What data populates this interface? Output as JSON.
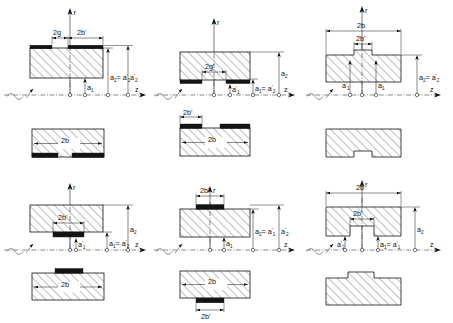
{
  "figure": {
    "axis_labels": {
      "radial": "r",
      "axial": "z"
    },
    "source_symbol": "ac-source-sine"
  },
  "symbols": {
    "two_b": "2b",
    "two_b_prime": "2b'",
    "two_g": "2g",
    "two_g_prime": "2g'",
    "a1": "a",
    "a1_sub": "1",
    "a2": "a",
    "a2_sub": "2"
  },
  "panels": [
    {
      "id": "r1c1",
      "name": "top-electrode-gap-section",
      "row": 1,
      "col": 1,
      "view": "cross-section",
      "electrode_side": "top",
      "notch": false,
      "dimensions": [
        {
          "name": "gap-width",
          "text": "2g"
        },
        {
          "name": "electrode-width",
          "text": "2b'"
        }
      ],
      "labels": [
        {
          "name": "a1-label",
          "text": "a",
          "sub": "1"
        },
        {
          "name": "a2-equals-a1prime-label",
          "text": "a",
          "sub": "2",
          "eq": "= a",
          "eq_sub": "1",
          "prime": true
        },
        {
          "name": "a2prime-label",
          "text": "a",
          "sub": "2",
          "prime": true
        }
      ],
      "axis_r": "r",
      "axis_z": "z"
    },
    {
      "id": "r1c2",
      "name": "bottom-electrode-gap-section",
      "row": 1,
      "col": 2,
      "view": "cross-section",
      "electrode_side": "bottom",
      "notch": false,
      "dimensions": [
        {
          "name": "gap-width",
          "text": "2g'"
        }
      ],
      "labels": [
        {
          "name": "a1prime-label",
          "text": "a",
          "sub": "1",
          "prime": true
        },
        {
          "name": "a1-equals-a2prime-label",
          "text": "a",
          "sub": "1",
          "eq": "= a",
          "eq_sub": "2",
          "prime": true
        },
        {
          "name": "a2-label",
          "text": "a",
          "sub": "2"
        }
      ],
      "axis_r": "r",
      "axis_z": "z"
    },
    {
      "id": "r1c3",
      "name": "top-notch-section",
      "row": 1,
      "col": 3,
      "view": "cross-section",
      "electrode_side": "none",
      "notch": "top",
      "dimensions": [
        {
          "name": "total-width",
          "text": "2b"
        },
        {
          "name": "notch-width",
          "text": "2b'"
        }
      ],
      "labels": [
        {
          "name": "a1prime-label",
          "text": "a",
          "sub": "1",
          "prime": true
        },
        {
          "name": "a1-label",
          "text": "a",
          "sub": "1"
        },
        {
          "name": "a2-equals-a2prime-label",
          "text": "a",
          "sub": "2",
          "eq": "= a",
          "eq_sub": "2",
          "prime": true
        }
      ],
      "axis_r": "r",
      "axis_z": "z"
    },
    {
      "id": "r2c1",
      "name": "bottom-electrode-gap-plan",
      "row": 2,
      "col": 1,
      "view": "plan",
      "electrode_side": "bottom",
      "notch": false,
      "inner_label": "2b",
      "dimensions": []
    },
    {
      "id": "r2c2",
      "name": "top-electrode-gap-plan",
      "row": 2,
      "col": 2,
      "view": "plan",
      "electrode_side": "top",
      "notch": false,
      "inner_label": "2b",
      "dimensions": [
        {
          "name": "electrode-width",
          "text": "2b'"
        }
      ]
    },
    {
      "id": "r2c3",
      "name": "bottom-notch-plan",
      "row": 2,
      "col": 3,
      "view": "plan",
      "electrode_side": "none",
      "notch": "bottom",
      "inner_label": "",
      "dimensions": []
    },
    {
      "id": "r3c1",
      "name": "bottom-center-electrode-section",
      "row": 3,
      "col": 1,
      "view": "cross-section",
      "electrode_side": "bottom-center",
      "notch": false,
      "dimensions": [
        {
          "name": "electrode-width",
          "text": "2b'"
        }
      ],
      "labels": [
        {
          "name": "a1prime-label",
          "text": "a",
          "sub": "1",
          "prime": true
        },
        {
          "name": "a1-equals-a2prime-label",
          "text": "a",
          "sub": "1",
          "eq": "= a",
          "eq_sub": "2",
          "prime": true
        },
        {
          "name": "a2-label",
          "text": "a",
          "sub": "2"
        }
      ],
      "axis_r": "r",
      "axis_z": "z"
    },
    {
      "id": "r3c2",
      "name": "top-center-electrode-section",
      "row": 3,
      "col": 2,
      "view": "cross-section",
      "electrode_side": "top-center",
      "notch": false,
      "dimensions": [
        {
          "name": "electrode-width",
          "text": "2b'"
        }
      ],
      "labels": [
        {
          "name": "a1-label",
          "text": "a",
          "sub": "1"
        },
        {
          "name": "a2-equals-a1prime-label",
          "text": "a",
          "sub": "2",
          "eq": "= a",
          "eq_sub": "1",
          "prime": true
        },
        {
          "name": "a2prime-label",
          "text": "a",
          "sub": "2",
          "prime": true
        }
      ],
      "axis_r": "r",
      "axis_z": "z"
    },
    {
      "id": "r3c3",
      "name": "bottom-notch-section",
      "row": 3,
      "col": 3,
      "view": "cross-section",
      "electrode_side": "none",
      "notch": "bottom",
      "dimensions": [
        {
          "name": "total-width",
          "text": "2b"
        },
        {
          "name": "notch-width",
          "text": "2b'"
        }
      ],
      "labels": [
        {
          "name": "a2prime-label",
          "text": "a",
          "sub": "2",
          "prime": true
        },
        {
          "name": "a1-equals-a1prime-label",
          "text": "a",
          "sub": "1",
          "eq": "= a",
          "eq_sub": "1",
          "prime": true
        },
        {
          "name": "a2-label",
          "text": "a",
          "sub": "2"
        }
      ],
      "axis_r": "r",
      "axis_z": "z"
    },
    {
      "id": "r4c1",
      "name": "top-center-electrode-plan",
      "row": 4,
      "col": 1,
      "view": "plan",
      "electrode_side": "top-center",
      "notch": false,
      "inner_label": "2b",
      "dimensions": []
    },
    {
      "id": "r4c2",
      "name": "bottom-center-electrode-plan",
      "row": 4,
      "col": 2,
      "view": "plan",
      "electrode_side": "bottom-center",
      "notch": false,
      "inner_label": "2b",
      "dimensions": [
        {
          "name": "electrode-width",
          "text": "2b'"
        }
      ]
    },
    {
      "id": "r4c3",
      "name": "top-notch-plan",
      "row": 4,
      "col": 3,
      "view": "plan",
      "electrode_side": "none",
      "notch": "top",
      "inner_label": "",
      "dimensions": []
    }
  ]
}
